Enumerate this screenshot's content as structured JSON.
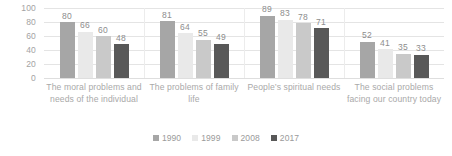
{
  "chart_data": {
    "type": "bar",
    "title": "",
    "subtitle": "",
    "xlabel": "",
    "ylabel": "",
    "ylim": [
      0,
      100
    ],
    "yticks": [
      100,
      80,
      60,
      40,
      20,
      0
    ],
    "grid": true,
    "legend_position": "bottom",
    "categories": [
      "The moral problems and needs of the individual",
      "The problems of family life",
      "People’s spiritual needs",
      "The social problems facing our country today"
    ],
    "series": [
      {
        "name": "1990",
        "color": "#a6a6a6",
        "values": [
          80,
          81,
          89,
          52
        ]
      },
      {
        "name": "1999",
        "color": "#e9e9e9",
        "values": [
          66,
          64,
          83,
          41
        ]
      },
      {
        "name": "2008",
        "color": "#c9c9c9",
        "values": [
          60,
          55,
          78,
          35
        ]
      },
      {
        "name": "2017",
        "color": "#585858",
        "values": [
          48,
          49,
          71,
          33
        ]
      }
    ]
  },
  "axis": {
    "y_tick_labels": [
      "100",
      "80",
      "60",
      "40",
      "20",
      "0"
    ]
  },
  "legend": {
    "items": [
      {
        "label": "1990",
        "color": "#a6a6a6"
      },
      {
        "label": "1999",
        "color": "#e9e9e9"
      },
      {
        "label": "2008",
        "color": "#c9c9c9"
      },
      {
        "label": "2017",
        "color": "#585858"
      }
    ]
  }
}
